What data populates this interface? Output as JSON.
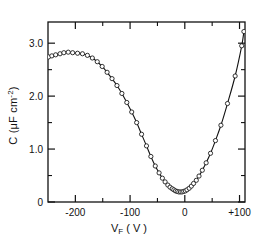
{
  "chart_data": {
    "type": "scatter",
    "title": "",
    "xlabel": "V_F (V)",
    "ylabel": "C ( µF cm^-2 )",
    "xlim": [
      -250,
      110
    ],
    "ylim": [
      0,
      3.4
    ],
    "xticks": [
      -200,
      -100,
      0,
      100
    ],
    "xticklabels": [
      "-200",
      "-100",
      "0",
      "+100"
    ],
    "yticks": [
      0,
      1.0,
      2.0,
      3.0
    ],
    "yticklabels": [
      "0",
      "1.0",
      "2.0",
      "3.0"
    ],
    "x_minor_interval": 50,
    "y_minor_interval": 0.5,
    "grid": false,
    "legend": null,
    "marker": "open-circle",
    "line": "solid",
    "series": [
      {
        "name": "C-V curve",
        "x": [
          -249,
          -243,
          -236,
          -228,
          -221,
          -213,
          -205,
          -196,
          -187,
          -178,
          -169,
          -160,
          -151,
          -142,
          -133,
          -124,
          -115,
          -106,
          -97,
          -88,
          -79,
          -70,
          -62,
          -54,
          -47,
          -41,
          -36,
          -31,
          -27,
          -23,
          -20,
          -17,
          -14,
          -11,
          -8,
          -5,
          -2,
          1,
          4,
          8,
          12,
          16,
          21,
          26,
          32,
          39,
          47,
          56,
          66,
          78,
          92,
          104,
          108
        ],
        "y": [
          2.74,
          2.76,
          2.78,
          2.8,
          2.82,
          2.83,
          2.82,
          2.81,
          2.8,
          2.77,
          2.72,
          2.65,
          2.56,
          2.45,
          2.33,
          2.2,
          2.05,
          1.88,
          1.7,
          1.5,
          1.28,
          1.06,
          0.86,
          0.68,
          0.55,
          0.45,
          0.38,
          0.32,
          0.28,
          0.25,
          0.23,
          0.21,
          0.2,
          0.19,
          0.19,
          0.19,
          0.2,
          0.21,
          0.23,
          0.26,
          0.3,
          0.35,
          0.41,
          0.49,
          0.6,
          0.74,
          0.92,
          1.16,
          1.45,
          1.86,
          2.38,
          2.95,
          3.22
        ]
      }
    ]
  },
  "axis": {
    "x_tick_labels": [
      {
        "label": "-200",
        "x": -200
      },
      {
        "label": "-100",
        "x": -100
      },
      {
        "label": "0",
        "x": 0
      },
      {
        "label": "+100",
        "x": 100
      }
    ],
    "y_tick_labels": [
      {
        "label": "0",
        "y": 0
      },
      {
        "label": "1.0",
        "y": 1.0
      },
      {
        "label": "2.0",
        "y": 2.0
      },
      {
        "label": "3.0",
        "y": 3.0
      }
    ]
  },
  "labels": {
    "y_axis_main": "C (",
    "y_axis_mu": "μF cm",
    "y_axis_exp": "-2",
    "y_axis_close": ")",
    "x_axis_main": "V",
    "x_axis_sub": "F",
    "x_axis_unit": " ( V )"
  },
  "colors": {
    "axis": "#111111",
    "curve": "#111111",
    "marker_fill": "#ffffff",
    "background": "#ffffff"
  }
}
